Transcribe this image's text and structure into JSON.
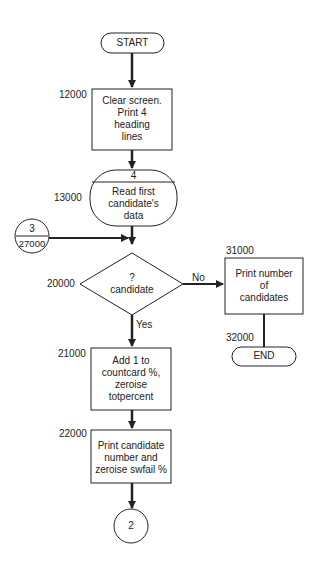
{
  "flowchart": {
    "start": {
      "label": "START"
    },
    "step_12000": {
      "line_no": "12000",
      "lines": [
        "Clear screen.",
        "Print 4",
        "heading",
        "lines"
      ]
    },
    "step_13000": {
      "line_no": "13000",
      "connector_id": "4",
      "lines": [
        "Read first",
        "candidate's",
        "data"
      ]
    },
    "connector_3": {
      "id": "3",
      "line_no": "27000"
    },
    "decision_20000": {
      "line_no": "20000",
      "lines": [
        "?",
        "candidate"
      ],
      "no_label": "No",
      "yes_label": "Yes"
    },
    "step_31000": {
      "line_no": "31000",
      "lines": [
        "Print number",
        "of",
        "candidates"
      ]
    },
    "end": {
      "line_no": "32000",
      "label": "END"
    },
    "step_21000": {
      "line_no": "21000",
      "lines": [
        "Add 1 to",
        "countcard %,",
        "zeroise",
        "totpercent"
      ]
    },
    "step_22000": {
      "line_no": "22000",
      "lines": [
        "Print candidate",
        "number and",
        "zeroise swfail %"
      ]
    },
    "connector_2": {
      "id": "2"
    }
  },
  "colors": {
    "stroke": "#222222",
    "background": "#ffffff"
  }
}
